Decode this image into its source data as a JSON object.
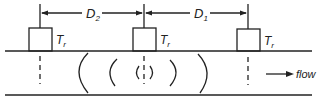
{
  "diagram": {
    "dimensions": [
      {
        "label_main": "D",
        "label_sub": "2"
      },
      {
        "label_main": "D",
        "label_sub": "1"
      }
    ],
    "transducers": [
      {
        "label_main": "T",
        "label_sub": "r"
      },
      {
        "label_main": "T",
        "label_sub": "r"
      },
      {
        "label_main": "T",
        "label_sub": "r"
      }
    ],
    "flow_label": "flow",
    "colors": {
      "ink": "#222222",
      "background": "#ffffff"
    }
  }
}
